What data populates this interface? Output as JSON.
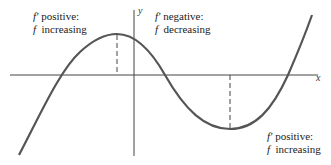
{
  "figure": {
    "axes": {
      "x_label": "x",
      "y_label": "y"
    },
    "annotations": [
      {
        "id": "left",
        "symbol_line1": "f′",
        "text_line1": "positive:",
        "symbol_line2": "f",
        "text_line2": "increasing"
      },
      {
        "id": "middle",
        "symbol_line1": "f′",
        "text_line1": "negative:",
        "symbol_line2": "f",
        "text_line2": "decreasing"
      },
      {
        "id": "right",
        "symbol_line1": "f′",
        "text_line1": "positive:",
        "symbol_line2": "f",
        "text_line2": "increasing"
      }
    ],
    "colors": {
      "curve": "#555555",
      "axes": "#444444",
      "dashed": "#444444",
      "text": "#222222"
    }
  }
}
